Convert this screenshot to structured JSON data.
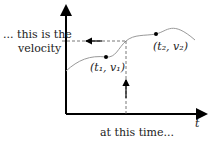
{
  "labels": {
    "velocity_line1": "... this is the",
    "velocity_line2": "velocity",
    "time": "at this time...",
    "x_axis": "t",
    "point1": "(t₁, v₁)",
    "point2": "(t₂, v₂)"
  },
  "colors": {
    "axis": "#000000",
    "curve": "#999999",
    "dashed": "#555555",
    "text": "#222222"
  }
}
